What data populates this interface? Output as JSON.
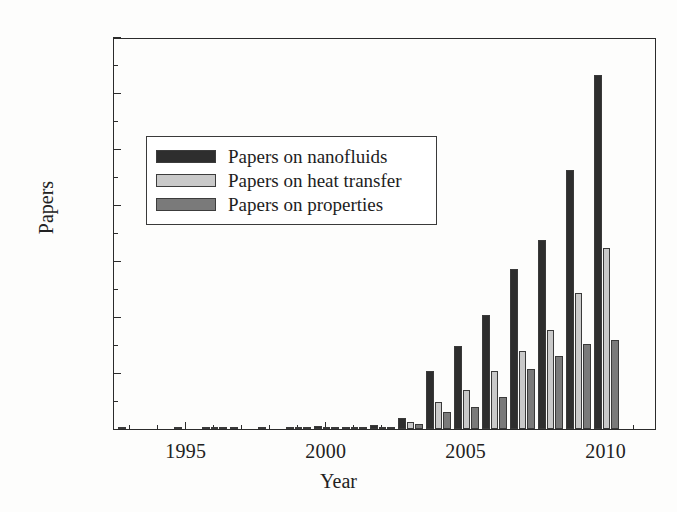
{
  "chart_data": {
    "type": "bar",
    "title": "",
    "xlabel": "Year",
    "ylabel": "Papers",
    "xlim": [
      1992.4,
      2011.8
    ],
    "ylim": [
      0,
      700
    ],
    "grid": false,
    "legend_position": "upper left",
    "categories": [
      1993,
      1994,
      1995,
      1996,
      1997,
      1998,
      1999,
      2000,
      2001,
      2002,
      2003,
      2004,
      2005,
      2006,
      2007,
      2008,
      2009,
      2010,
      2011
    ],
    "series": [
      {
        "name": "Papers on nanofluids",
        "color": "#2e2e2e",
        "values": [
          1,
          0,
          1,
          2,
          1,
          1,
          2,
          5,
          4,
          7,
          20,
          104,
          148,
          204,
          286,
          338,
          462,
          632,
          0
        ]
      },
      {
        "name": "Papers on heat transfer",
        "color": "#c9c9c9",
        "values": [
          0,
          0,
          0,
          1,
          0,
          0,
          1,
          2,
          2,
          3,
          12,
          48,
          70,
          103,
          139,
          176,
          242,
          324,
          0
        ]
      },
      {
        "name": "Papers on properties",
        "color": "#7a7a7a",
        "values": [
          0,
          0,
          0,
          1,
          0,
          0,
          1,
          2,
          2,
          3,
          9,
          30,
          40,
          57,
          108,
          130,
          151,
          159,
          0
        ]
      }
    ],
    "y_major_ticks": [
      0,
      100,
      200,
      300,
      400,
      500,
      600,
      700
    ],
    "y_minor_ticks": [
      50,
      150,
      250,
      350,
      450,
      550,
      650
    ],
    "x_major_ticks": [
      1995,
      2000,
      2005,
      2010
    ],
    "x_minor_ticks": [
      1993,
      1994,
      1996,
      1997,
      1998,
      1999,
      2001,
      2002,
      2003,
      2004,
      2006,
      2007,
      2008,
      2009,
      2011
    ],
    "x_tick_labels": [
      "1995",
      "2000",
      "2005",
      "2010"
    ],
    "y_tick_labels": [
      "0",
      "100",
      "200",
      "300",
      "400",
      "500",
      "600",
      "700"
    ]
  },
  "legend": {
    "items": [
      {
        "label": "Papers on nanofluids"
      },
      {
        "label": "Papers on heat transfer"
      },
      {
        "label": "Papers on properties"
      }
    ]
  },
  "axes": {
    "y_title": "Papers",
    "x_title": "Year"
  }
}
